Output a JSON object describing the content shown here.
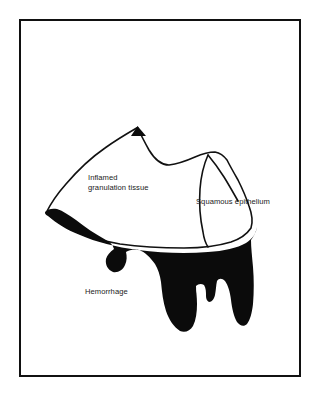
{
  "figure": {
    "type": "medical-illustration",
    "title": "",
    "background_color": "#ffffff",
    "frame": {
      "name": "figure-border",
      "color": "#111111",
      "style": "solid-rectangle"
    },
    "regions": [
      {
        "id": "inflamed-granulation-tissue",
        "label_line_1": "Inflamed",
        "label_line_2": "granulation tissue",
        "fill": "#ffffff",
        "stroke": "#111111"
      },
      {
        "id": "squamous-epithelium",
        "label": "Squamous epithelium",
        "fill": "#ffffff",
        "stroke": "#111111"
      },
      {
        "id": "hemorrhage",
        "label": "Hemorrhage",
        "fill": "#0b0b0b",
        "stroke": "none"
      }
    ]
  },
  "labels": {
    "inflamed_line1": "Inflamed",
    "inflamed_line2": "granulation tissue",
    "squamous": "Squamous epithelium",
    "hemorrhage": "Hemorrhage"
  },
  "colors": {
    "ink": "#111111",
    "fill_black": "#0b0b0b",
    "paper": "#ffffff",
    "text": "#1a1a1a"
  }
}
